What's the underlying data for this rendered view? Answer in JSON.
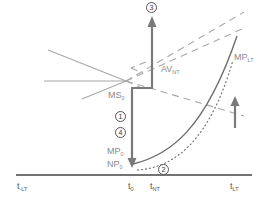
{
  "diagram": {
    "colors": {
      "line": "#a0a0a0",
      "step": "#7a7a7a",
      "curve": "#6e6e6e",
      "axis": "#444444",
      "label": "#8a8a8a"
    },
    "labels": {
      "ms0": {
        "main": "MS",
        "sub": "0"
      },
      "mp0": {
        "main": "MP",
        "sub": "0"
      },
      "np0": {
        "main": "NP",
        "sub": "0"
      },
      "av_nt": {
        "main": "AV",
        "sub": "NT"
      },
      "mp_lt": {
        "main": "MP",
        "sub": "LT"
      }
    },
    "axis_ticks": [
      {
        "main": "t",
        "sub": "-LT"
      },
      {
        "main": "t",
        "sub": "0"
      },
      {
        "main": "t",
        "sub": "NT"
      },
      {
        "main": "t",
        "sub": "LT"
      }
    ],
    "steps": [
      {
        "id": "1",
        "glyph": "1"
      },
      {
        "id": "2",
        "glyph": "2"
      },
      {
        "id": "3",
        "glyph": "3"
      },
      {
        "id": "4",
        "glyph": "4"
      }
    ]
  }
}
